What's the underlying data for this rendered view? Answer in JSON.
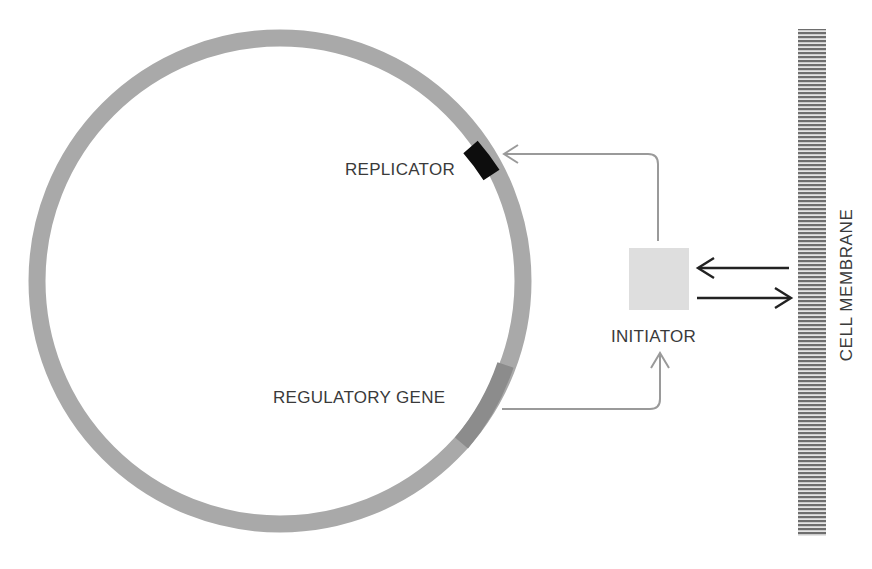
{
  "diagram": {
    "labels": {
      "replicator": "REPLICATOR",
      "regulatory_gene": "REGULATORY GENE",
      "initiator": "INITIATOR",
      "cell_membrane": "CELL MEMBRANE"
    },
    "colors": {
      "background": "#ffffff",
      "chromosome_ring": "#a9a9a9",
      "regulatory_gene_segment": "#8c8c8c",
      "replicator_segment": "#0d0d0d",
      "initiator_box": "#dedede",
      "connector_arrows": "#9a9a9a",
      "membrane_arrows": "#222222",
      "membrane_stripes": "#6e6e6e",
      "text": "#3a3a3a"
    },
    "elements": [
      {
        "id": "chromosome",
        "shape": "ring"
      },
      {
        "id": "replicator",
        "shape": "ring-segment",
        "color": "black"
      },
      {
        "id": "regulatory_gene",
        "shape": "ring-segment",
        "color": "dark-gray"
      },
      {
        "id": "initiator",
        "shape": "square",
        "color": "light-gray"
      },
      {
        "id": "cell_membrane",
        "shape": "striped-bar"
      }
    ],
    "connections": [
      {
        "from": "regulatory_gene",
        "to": "initiator",
        "style": "gray-arrow"
      },
      {
        "from": "initiator",
        "to": "replicator",
        "style": "gray-arrow"
      },
      {
        "from": "cell_membrane",
        "to": "initiator",
        "style": "black-arrow"
      },
      {
        "from": "initiator",
        "to": "cell_membrane",
        "style": "black-arrow"
      }
    ]
  }
}
